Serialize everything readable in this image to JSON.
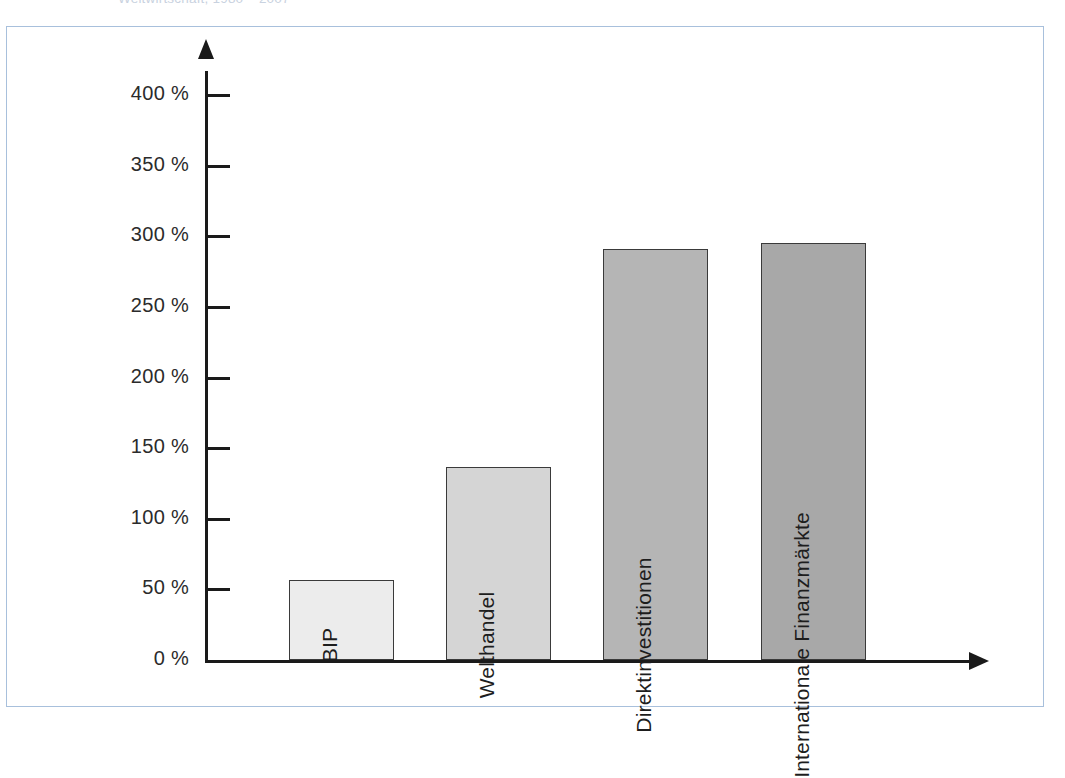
{
  "caption": {
    "text": "Weltwirtschaft, 1980 – 2007"
  },
  "frame": {
    "border_color": "#a8c0dc",
    "background": "#ffffff"
  },
  "axes": {
    "axis_color": "#1a1a1a",
    "y_tick_labels": [
      "400 %",
      "350 %",
      "300 %",
      "250 %",
      "200 %",
      "150 %",
      "100 %",
      "50 %",
      "0 %"
    ],
    "y_tick_values": [
      400,
      350,
      300,
      250,
      200,
      150,
      100,
      50,
      0
    ]
  },
  "chart_data": {
    "type": "bar",
    "title": "",
    "xlabel": "",
    "ylabel": "",
    "ylim": [
      0,
      400
    ],
    "grid": false,
    "legend": "none",
    "unit": "%",
    "categories": [
      "BIP",
      "Welthandel",
      "Direktinvestitionen",
      "Internationale Finanzmärkte"
    ],
    "values": [
      57,
      137,
      291,
      295
    ],
    "tick_labels": [
      "0 %",
      "50 %",
      "100 %",
      "150 %",
      "200 %",
      "250 %",
      "300 %",
      "350 %",
      "400 %"
    ],
    "bar_colors": [
      "#ececec",
      "#d5d5d5",
      "#b5b5b5",
      "#a8a8a8"
    ],
    "bar_border_color": "#3a3a3a",
    "bars": [
      {
        "label": "BIP",
        "value": 57,
        "color": "#ececec"
      },
      {
        "label": "Welthandel",
        "value": 137,
        "color": "#d5d5d5"
      },
      {
        "label": "Direktinvestitionen",
        "value": 291,
        "color": "#b5b5b5"
      },
      {
        "label": "Internationale Finanzmärkte",
        "value": 295,
        "color": "#a8a8a8"
      }
    ]
  }
}
